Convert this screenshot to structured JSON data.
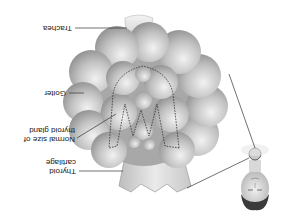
{
  "figure": {
    "orientation": "rotated 180 degrees",
    "labels": {
      "trachea": "Trachea",
      "goiter": "Goiter",
      "normal_size_line1": "Normal size of",
      "normal_size_line2": "thyroid gland",
      "thyroid_cartilage_line1": "Thyroid",
      "thyroid_cartilage_line2": "cartilage"
    },
    "colors": {
      "background": "#ffffff",
      "gland_fill": "#b8b8b8",
      "gland_highlight": "#e6e6e6",
      "gland_shadow": "#8a8a8a",
      "leader_line": "#333333",
      "dashed_outline": "#333333",
      "label_text": "#222222"
    }
  }
}
